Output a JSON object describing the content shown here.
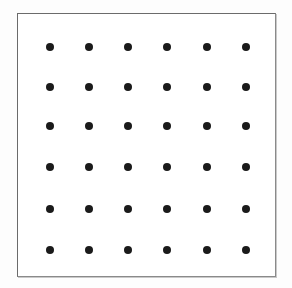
{
  "figure": {
    "background_color": "#fdfdfd",
    "panel_color": "#ffffff",
    "border_color": "#6b6b6b",
    "dot_color": "#1a1a1a"
  },
  "frame": {
    "x": 17,
    "y": 13,
    "width": 259,
    "height": 264,
    "border_width": 1
  },
  "chart_data": {
    "type": "scatter",
    "title": "",
    "xlabel": "",
    "ylabel": "",
    "grid": false,
    "legend": null,
    "rows": 6,
    "columns": 6,
    "point_count": 36,
    "dot_diameter": 8,
    "column_spacing": 39.2,
    "row_spacing": 40.6,
    "column_centers": [
      49,
      88,
      127,
      166,
      206,
      245
    ],
    "row_centers": [
      46,
      86,
      125,
      166,
      208,
      249
    ],
    "x": [
      49,
      88,
      127,
      166,
      206,
      245,
      49,
      88,
      127,
      166,
      206,
      245,
      49,
      88,
      127,
      166,
      206,
      245,
      49,
      88,
      127,
      166,
      206,
      245,
      49,
      88,
      127,
      166,
      206,
      245,
      49,
      88,
      127,
      166,
      206,
      245
    ],
    "y": [
      46,
      46,
      46,
      46,
      46,
      46,
      86,
      86,
      86,
      86,
      86,
      86,
      125,
      125,
      125,
      125,
      125,
      125,
      166,
      166,
      166,
      166,
      166,
      166,
      208,
      208,
      208,
      208,
      208,
      208,
      249,
      249,
      249,
      249,
      249,
      249
    ],
    "xlim": [
      17,
      276
    ],
    "ylim": [
      13,
      277
    ]
  }
}
